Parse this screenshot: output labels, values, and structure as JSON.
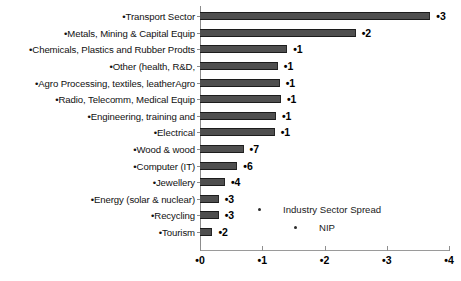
{
  "chart_data": {
    "type": "bar",
    "orientation": "horizontal",
    "title": "",
    "xlabel": "",
    "ylabel": "",
    "xlim": [
      0,
      4
    ],
    "grid": false,
    "legend_position": "inside-lower-right",
    "xticks": [
      "•0",
      "•1",
      "•2",
      "•3",
      "•4"
    ],
    "xtick_values": [
      0,
      1,
      2,
      3,
      4
    ],
    "categories": [
      "•Transport Sector",
      "•Metals, Mining & Capital Equip",
      "•Chemicals, Plastics and Rubber Prodts",
      "•Other (health, R&D,",
      "•Agro Processing, textiles, leatherAgro",
      "•Radio, Telecomm, Medical Equip",
      "•Engineering, training and",
      "•Electrical",
      "•Wood & wood",
      "•Computer (IT)",
      "•Jewellery",
      "•Energy (solar & nuclear)",
      "•Recycling",
      "•Tourism"
    ],
    "values": [
      3.7,
      2.5,
      1.4,
      1.25,
      1.28,
      1.3,
      1.22,
      1.2,
      0.7,
      0.6,
      0.4,
      0.3,
      0.3,
      0.2
    ],
    "value_labels": [
      "•3",
      "•2",
      "•1",
      "•1",
      "•1",
      "•1",
      "•1",
      "•1",
      "•7",
      "•6",
      "•4",
      "•3",
      "•3",
      "•2"
    ],
    "series": [
      {
        "name": "Industry Sector Spread",
        "values": [
          3.7,
          2.5,
          1.4,
          1.25,
          1.28,
          1.3,
          1.22,
          1.2,
          0.7,
          0.6,
          0.4,
          0.3,
          0.3,
          0.2
        ]
      }
    ],
    "legend": [
      {
        "label": "Industry Sector Spread"
      },
      {
        "label": "NIP"
      }
    ],
    "colors": {
      "bar_fill": "#4f4f4f",
      "bar_edge": "#1c1c1c",
      "axis": "#8c8c8c",
      "text": "#000000",
      "background": "#ffffff"
    }
  }
}
